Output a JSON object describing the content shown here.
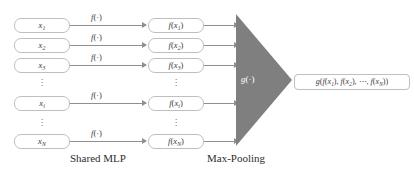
{
  "diagram": {
    "colors": {
      "triangle_fill": "#7f7f7f",
      "box_border": "#bfbfbf",
      "arrow": "#8f8f8f",
      "text": "#3a3a3a",
      "background": "#ffffff",
      "pool_label_text": "#ffffff"
    },
    "input_nodes": [
      {
        "label": "x1",
        "var": "x",
        "sub": "1"
      },
      {
        "label": "x2",
        "var": "x",
        "sub": "2"
      },
      {
        "label": "x3",
        "var": "x",
        "sub": "3"
      },
      {
        "label": "xi",
        "var": "x",
        "sub": "i"
      },
      {
        "label": "xN",
        "var": "x",
        "sub": "N"
      }
    ],
    "feature_nodes": [
      {
        "label": "f(x1)",
        "fn": "f",
        "var": "x",
        "sub": "1"
      },
      {
        "label": "f(x2)",
        "fn": "f",
        "var": "x",
        "sub": "2"
      },
      {
        "label": "f(x3)",
        "fn": "f",
        "var": "x",
        "sub": "3"
      },
      {
        "label": "f(xi)",
        "fn": "f",
        "var": "x",
        "sub": "i"
      },
      {
        "label": "f(xN)",
        "fn": "f",
        "var": "x",
        "sub": "N"
      }
    ],
    "mlp_arrow_labels": [
      "f(·)",
      "f(·)",
      "f(·)",
      "f(·)",
      "f(·)"
    ],
    "pool_label": "g(·)",
    "output_node": {
      "label": "g(f(x1), f(x2), ⋯, f(xN))",
      "fn": "g",
      "terms": [
        "f(x1)",
        "f(x2)",
        "f(xN)"
      ],
      "ellipsis": "⋯"
    },
    "captions": {
      "mlp": "Shared MLP",
      "pooling": "Max-Pooling"
    },
    "ellipsis_marker": "⋮"
  }
}
